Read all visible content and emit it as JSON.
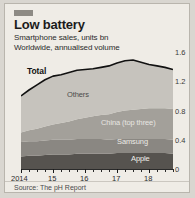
{
  "card": {
    "tag_icon": "brand-tag-mark",
    "title": "Low battery",
    "subtitle_line1": "Smartphone sales, units bn",
    "subtitle_line2": "Worldwide, annualised volume",
    "source": "Source: The pH Report"
  },
  "colors": {
    "background": "#efece6",
    "border": "#b9b5ad",
    "total_line": "#111111",
    "others": "#c6c3bd",
    "china": "#a3a09a",
    "samsung": "#8a8782",
    "apple": "#56534f",
    "axis": "#2a2a2a",
    "text": "#2b2b2b"
  },
  "chart_data": {
    "type": "area",
    "stacked": true,
    "title": "Low battery",
    "subtitle": "Smartphone sales, units bn — Worldwide, annualised volume",
    "xlabel": "",
    "ylabel": "units bn",
    "ylim": [
      0,
      1.6
    ],
    "yticks": [
      0,
      0.4,
      0.8,
      1.2,
      1.6
    ],
    "ytick_labels": [
      "0",
      "0.4",
      "0.8",
      "1.2",
      "1.6"
    ],
    "y_axis_position": "right",
    "grid": false,
    "legend": "in-chart labels",
    "xlim": [
      2014,
      2018.75
    ],
    "xticks": [
      2014,
      2015,
      2016,
      2017,
      2018
    ],
    "xtick_labels": [
      "2014",
      "15",
      "16",
      "17",
      "18"
    ],
    "x": [
      2014.0,
      2014.25,
      2014.5,
      2014.75,
      2015.0,
      2015.25,
      2015.5,
      2015.75,
      2016.0,
      2016.25,
      2016.5,
      2016.75,
      2017.0,
      2017.25,
      2017.5,
      2017.75,
      2018.0,
      2018.25,
      2018.5,
      2018.75
    ],
    "series": [
      {
        "name": "Apple",
        "values": [
          0.17,
          0.18,
          0.18,
          0.19,
          0.2,
          0.2,
          0.2,
          0.21,
          0.21,
          0.21,
          0.21,
          0.21,
          0.22,
          0.22,
          0.22,
          0.22,
          0.22,
          0.22,
          0.22,
          0.21
        ]
      },
      {
        "name": "Samsung",
        "values": [
          0.2,
          0.2,
          0.2,
          0.2,
          0.2,
          0.2,
          0.2,
          0.2,
          0.2,
          0.2,
          0.2,
          0.19,
          0.19,
          0.19,
          0.19,
          0.19,
          0.19,
          0.19,
          0.19,
          0.19
        ]
      },
      {
        "name": "China (top three)",
        "values": [
          0.13,
          0.15,
          0.17,
          0.19,
          0.21,
          0.23,
          0.25,
          0.27,
          0.29,
          0.31,
          0.33,
          0.35,
          0.37,
          0.39,
          0.4,
          0.41,
          0.42,
          0.42,
          0.42,
          0.42
        ]
      },
      {
        "name": "Others",
        "values": [
          0.5,
          0.55,
          0.6,
          0.64,
          0.66,
          0.66,
          0.67,
          0.67,
          0.66,
          0.65,
          0.65,
          0.66,
          0.67,
          0.68,
          0.68,
          0.64,
          0.6,
          0.58,
          0.56,
          0.54
        ]
      }
    ],
    "total_line": {
      "name": "Total",
      "values": [
        1.0,
        1.08,
        1.15,
        1.22,
        1.27,
        1.29,
        1.32,
        1.35,
        1.36,
        1.37,
        1.39,
        1.41,
        1.45,
        1.48,
        1.49,
        1.46,
        1.43,
        1.41,
        1.39,
        1.36
      ]
    },
    "annotations": [
      {
        "label": "Total",
        "series": "Total"
      },
      {
        "label": "Others",
        "series": "Others"
      },
      {
        "label": "China (top three)",
        "series": "China (top three)"
      },
      {
        "label": "Samsung",
        "series": "Samsung"
      },
      {
        "label": "Apple",
        "series": "Apple"
      }
    ]
  }
}
